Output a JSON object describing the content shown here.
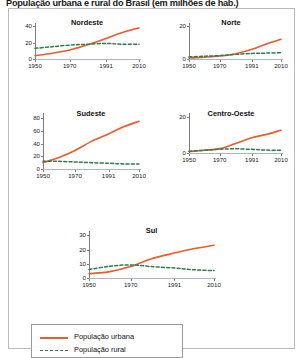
{
  "title": "População urbana e rural do Brasil (em milhões de hab.)",
  "credit": "Allmaps/Arquivo da editora",
  "legend": {
    "urban_label": "População urbana",
    "rural_label": "População rural",
    "urban_color": "#EA5B2A",
    "rural_color": "#2E7D4F"
  },
  "chart_data": [
    {
      "type": "line",
      "title": "Nordeste",
      "xlabel": "",
      "ylabel": "",
      "x": [
        1950,
        1960,
        1970,
        1980,
        1991,
        2000,
        2010
      ],
      "xticks": [
        "1950",
        "1970",
        "1991",
        "2010"
      ],
      "xtick_values": [
        1950,
        1970,
        1991,
        2010
      ],
      "yticks": [
        "0",
        "20",
        "40"
      ],
      "ytick_values": [
        0,
        20,
        40
      ],
      "ylim": [
        0,
        44
      ],
      "xlim": [
        1950,
        2010
      ],
      "grid": false,
      "series": [
        {
          "name": "População urbana",
          "color": "#EA5B2A",
          "style": "solid",
          "values": [
            4,
            7,
            11,
            17,
            25,
            32,
            38
          ]
        },
        {
          "name": "População rural",
          "color": "#2E7D4F",
          "style": "dashed",
          "values": [
            13,
            15,
            17,
            18,
            19,
            18,
            18
          ]
        }
      ]
    },
    {
      "type": "line",
      "title": "Norte",
      "xlabel": "",
      "ylabel": "",
      "x": [
        1950,
        1960,
        1970,
        1980,
        1991,
        2000,
        2010
      ],
      "xticks": [
        "1950",
        "1970",
        "1991",
        "2010"
      ],
      "xtick_values": [
        1950,
        1970,
        1991,
        2010
      ],
      "yticks": [
        "0",
        "20"
      ],
      "ytick_values": [
        0,
        20
      ],
      "ylim": [
        0,
        22
      ],
      "xlim": [
        1950,
        2010
      ],
      "grid": false,
      "series": [
        {
          "name": "População urbana",
          "color": "#EA5B2A",
          "style": "solid",
          "values": [
            0.6,
            1.1,
            1.8,
            3.1,
            5.9,
            9.0,
            12.0
          ]
        },
        {
          "name": "População rural",
          "color": "#2E7D4F",
          "style": "dashed",
          "values": [
            1.3,
            1.7,
            2.1,
            2.8,
            3.4,
            3.6,
            3.8
          ]
        }
      ]
    },
    {
      "type": "line",
      "title": "Sudeste",
      "xlabel": "",
      "ylabel": "",
      "x": [
        1950,
        1960,
        1970,
        1980,
        1991,
        2000,
        2010
      ],
      "xticks": [
        "1950",
        "1970",
        "1991",
        "2010"
      ],
      "xtick_values": [
        1950,
        1970,
        1991,
        2010
      ],
      "yticks": [
        "0",
        "20",
        "40",
        "60",
        "80"
      ],
      "ytick_values": [
        0,
        20,
        40,
        60,
        80
      ],
      "ylim": [
        0,
        88
      ],
      "xlim": [
        1950,
        2010
      ],
      "grid": false,
      "series": [
        {
          "name": "População urbana",
          "color": "#EA5B2A",
          "style": "solid",
          "values": [
            10,
            18,
            29,
            43,
            55,
            66,
            75
          ]
        },
        {
          "name": "População rural",
          "color": "#2E7D4F",
          "style": "dashed",
          "values": [
            12,
            12,
            11,
            10,
            9,
            8,
            8
          ]
        }
      ]
    },
    {
      "type": "line",
      "title": "Centro-Oeste",
      "xlabel": "",
      "ylabel": "",
      "x": [
        1950,
        1960,
        1970,
        1980,
        1991,
        2000,
        2010
      ],
      "xticks": [
        "1950",
        "1970",
        "1991",
        "2010"
      ],
      "xtick_values": [
        1950,
        1970,
        1991,
        2010
      ],
      "yticks": [
        "0",
        "20"
      ],
      "ytick_values": [
        0,
        20
      ],
      "ylim": [
        0,
        22
      ],
      "xlim": [
        1950,
        2010
      ],
      "grid": false,
      "series": [
        {
          "name": "População urbana",
          "color": "#EA5B2A",
          "style": "solid",
          "values": [
            0.7,
            1.5,
            2.4,
            5.1,
            8.4,
            10.1,
            12.5
          ]
        },
        {
          "name": "População rural",
          "color": "#2E7D4F",
          "style": "dashed",
          "values": [
            1.0,
            1.5,
            2.1,
            2.3,
            2.0,
            1.6,
            1.5
          ]
        }
      ]
    },
    {
      "type": "line",
      "title": "Sul",
      "xlabel": "",
      "ylabel": "",
      "x": [
        1950,
        1960,
        1970,
        1980,
        1991,
        2000,
        2010
      ],
      "xticks": [
        "1950",
        "1970",
        "1991",
        "2010"
      ],
      "xtick_values": [
        1950,
        1970,
        1991,
        2010
      ],
      "yticks": [
        "0",
        "10",
        "20",
        "30"
      ],
      "ytick_values": [
        0,
        10,
        20,
        30
      ],
      "ylim": [
        0,
        33
      ],
      "xlim": [
        1950,
        2010
      ],
      "grid": false,
      "series": [
        {
          "name": "População urbana",
          "color": "#EA5B2A",
          "style": "solid",
          "values": [
            3.0,
            4.5,
            8.0,
            13.5,
            17.5,
            20.5,
            23.0
          ]
        },
        {
          "name": "População rural",
          "color": "#2E7D4F",
          "style": "dashed",
          "values": [
            6.0,
            8.2,
            9.2,
            8.0,
            7.0,
            5.8,
            5.2
          ]
        }
      ]
    }
  ]
}
